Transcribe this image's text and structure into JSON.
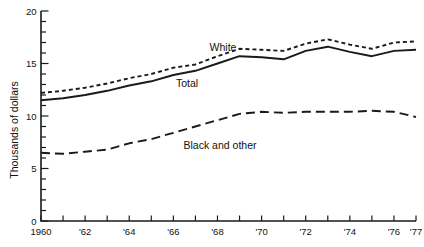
{
  "colors": {
    "ink": "#1a1a1a",
    "background": "#ffffff"
  },
  "chart_data": {
    "type": "line",
    "title": "",
    "xlabel": "",
    "ylabel": "Thousands of dollars",
    "grid": false,
    "legend": "inline-labels",
    "xlim": [
      1960,
      1977
    ],
    "ylim": [
      0,
      20
    ],
    "x": [
      1960,
      1961,
      1962,
      1963,
      1964,
      1965,
      1966,
      1967,
      1968,
      1969,
      1970,
      1971,
      1972,
      1973,
      1974,
      1975,
      1976,
      1977
    ],
    "x_tick_years": [
      1960,
      1962,
      1964,
      1966,
      1968,
      1970,
      1972,
      1974,
      1976,
      1977
    ],
    "x_tick_labels": [
      "1960",
      "'62",
      "'64",
      "'66",
      "'68",
      "'70",
      "'72",
      "'74",
      "'76",
      "'77"
    ],
    "y_ticks": [
      0,
      5,
      10,
      15,
      20
    ],
    "y_minor_tick_step": 1,
    "series": [
      {
        "name": "White",
        "style": "short-dash",
        "values": [
          12.2,
          12.4,
          12.7,
          13.1,
          13.6,
          14.0,
          14.6,
          14.9,
          15.7,
          16.4,
          16.3,
          16.2,
          16.9,
          17.3,
          16.8,
          16.4,
          17.0,
          17.1
        ]
      },
      {
        "name": "Total",
        "style": "solid",
        "values": [
          11.5,
          11.7,
          12.0,
          12.4,
          12.9,
          13.3,
          13.9,
          14.3,
          15.0,
          15.7,
          15.6,
          15.4,
          16.2,
          16.6,
          16.1,
          15.7,
          16.2,
          16.3
        ]
      },
      {
        "name": "Black and other",
        "style": "long-dash",
        "values": [
          6.5,
          6.4,
          6.6,
          6.8,
          7.4,
          7.8,
          8.4,
          9.0,
          9.6,
          10.2,
          10.4,
          10.3,
          10.4,
          10.4,
          10.4,
          10.5,
          10.4,
          9.9
        ]
      }
    ]
  }
}
